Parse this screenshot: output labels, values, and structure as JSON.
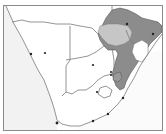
{
  "map": {
    "region": "Southern Africa",
    "colors": {
      "background": "#ffffff",
      "ocean": "#ffffff",
      "land": "#ffffff",
      "left_margin": "#e8e8e8",
      "border_line": "#7a7a7a",
      "frame": "#8a8a8a",
      "highlight_dark": "#8c8c8c",
      "highlight_light": "#c6c6c6",
      "city_dot": "#222222"
    },
    "highlighted_areas": [
      {
        "name": "dark-shaded-region",
        "shade": "dark"
      },
      {
        "name": "light-shaded-lake-region",
        "shade": "light"
      }
    ],
    "cities": [
      {
        "name": "city-1",
        "x": 31,
        "y": 54
      },
      {
        "name": "city-2",
        "x": 45,
        "y": 53
      },
      {
        "name": "city-3",
        "x": 127,
        "y": 24
      },
      {
        "name": "city-4",
        "x": 153,
        "y": 34
      },
      {
        "name": "city-5",
        "x": 93,
        "y": 65
      },
      {
        "name": "city-6",
        "x": 111,
        "y": 72
      },
      {
        "name": "city-7",
        "x": 111,
        "y": 75
      },
      {
        "name": "city-8",
        "x": 97,
        "y": 92
      },
      {
        "name": "city-9",
        "x": 123,
        "y": 98
      },
      {
        "name": "city-10",
        "x": 108,
        "y": 114
      },
      {
        "name": "city-11",
        "x": 93,
        "y": 121
      },
      {
        "name": "city-12",
        "x": 57,
        "y": 123
      }
    ]
  }
}
